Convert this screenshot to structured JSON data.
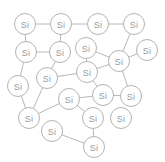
{
  "diagram": {
    "element_symbol": "Si",
    "colors": {
      "background": "#ffffff",
      "node_fill": "#ffffff",
      "node_stroke": "#b4b4b4",
      "bond_stroke": "#b8b8b8",
      "label_color": "#9a9a9a"
    },
    "canvas": {
      "width": 165,
      "height": 162
    },
    "node_radius": 10.5,
    "nodes": [
      {
        "id": "a1",
        "label": "Si",
        "x": 25,
        "y": 24
      },
      {
        "id": "a2",
        "label": "Si",
        "x": 61,
        "y": 24
      },
      {
        "id": "a3",
        "label": "Si",
        "x": 98,
        "y": 24
      },
      {
        "id": "a4",
        "label": "Si",
        "x": 134,
        "y": 24
      },
      {
        "id": "a5",
        "label": "Si",
        "x": 26,
        "y": 52
      },
      {
        "id": "a6",
        "label": "Si",
        "x": 60,
        "y": 52
      },
      {
        "id": "a7",
        "label": "Si",
        "x": 86,
        "y": 48
      },
      {
        "id": "a8",
        "label": "Si",
        "x": 147,
        "y": 50
      },
      {
        "id": "a9",
        "label": "Si",
        "x": 119,
        "y": 61
      },
      {
        "id": "a10",
        "label": "Si",
        "x": 87,
        "y": 72
      },
      {
        "id": "a11",
        "label": "Si",
        "x": 47,
        "y": 78
      },
      {
        "id": "a12",
        "label": "Si",
        "x": 18,
        "y": 86
      },
      {
        "id": "a13",
        "label": "Si",
        "x": 103,
        "y": 95
      },
      {
        "id": "a14",
        "label": "Si",
        "x": 131,
        "y": 96
      },
      {
        "id": "a15",
        "label": "Si",
        "x": 69,
        "y": 99
      },
      {
        "id": "a16",
        "label": "Si",
        "x": 29,
        "y": 118
      },
      {
        "id": "a17",
        "label": "Si",
        "x": 93,
        "y": 118
      },
      {
        "id": "a18",
        "label": "Si",
        "x": 121,
        "y": 118
      },
      {
        "id": "a19",
        "label": "Si",
        "x": 52,
        "y": 131
      },
      {
        "id": "a20",
        "label": "Si",
        "x": 94,
        "y": 147
      }
    ],
    "bonds": [
      {
        "from": "a1",
        "to": "a2"
      },
      {
        "from": "a2",
        "to": "a3"
      },
      {
        "from": "a3",
        "to": "a4"
      },
      {
        "from": "a1",
        "to": "a5"
      },
      {
        "from": "a2",
        "to": "a6"
      },
      {
        "from": "a4",
        "to": "a9"
      },
      {
        "from": "a5",
        "to": "a6"
      },
      {
        "from": "a7",
        "to": "a9"
      },
      {
        "from": "a8",
        "to": "a9"
      },
      {
        "from": "a6",
        "to": "a11"
      },
      {
        "from": "a9",
        "to": "a10"
      },
      {
        "from": "a10",
        "to": "a11"
      },
      {
        "from": "a5",
        "to": "a12"
      },
      {
        "from": "a11",
        "to": "a16"
      },
      {
        "from": "a12",
        "to": "a16"
      },
      {
        "from": "a10",
        "to": "a13"
      },
      {
        "from": "a9",
        "to": "a14"
      },
      {
        "from": "a13",
        "to": "a14"
      },
      {
        "from": "a13",
        "to": "a15"
      },
      {
        "from": "a15",
        "to": "a16"
      },
      {
        "from": "a15",
        "to": "a17"
      },
      {
        "from": "a17",
        "to": "a20"
      },
      {
        "from": "a19",
        "to": "a20"
      },
      {
        "from": "a7",
        "to": "a10"
      }
    ]
  }
}
